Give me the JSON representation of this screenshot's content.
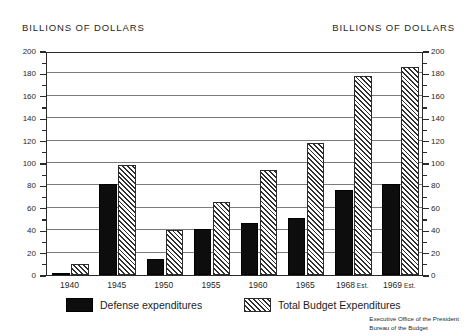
{
  "header": {
    "left_axis_title": "BILLIONS OF DOLLARS",
    "right_axis_title": "BILLIONS OF DOLLARS"
  },
  "legend": {
    "defense_label": "Defense expenditures",
    "total_label": "Total Budget Expenditures"
  },
  "footer": {
    "line1": "Executive Office of the President",
    "line2": "Bureau of the Budget"
  },
  "colors": {
    "defense_fill": "#0d0d0d",
    "total_hatch": "#2f2f2f",
    "total_background": "#f2f2f2",
    "frame": "#2a2a2a",
    "gridline": "#7b7b7b",
    "page_background": "#ffffff"
  },
  "chart_data": {
    "type": "bar",
    "title": "",
    "subtitle": "",
    "xlabel": "",
    "ylabel": "BILLIONS OF DOLLARS",
    "ylabel_right": "BILLIONS OF DOLLARS",
    "ylim": [
      0,
      200
    ],
    "yticks": [
      0,
      20,
      40,
      60,
      80,
      100,
      120,
      140,
      160,
      180,
      200
    ],
    "ytick_labels": [
      "0",
      "20",
      "40",
      "60",
      "80",
      "100",
      "120",
      "140",
      "160",
      "180",
      "200"
    ],
    "yminor_step": 10,
    "grid": true,
    "grid_axis": "y",
    "legend_position": "below",
    "dual_axis": true,
    "categories": [
      "1940",
      "1945",
      "1950",
      "1955",
      "1960",
      "1965",
      "1968 Est.",
      "1969 Est."
    ],
    "category_main": [
      "1940",
      "1945",
      "1950",
      "1955",
      "1960",
      "1965",
      "1968",
      "1969"
    ],
    "category_suffix": [
      "",
      "",
      "",
      "",
      "",
      "",
      "Est.",
      "Est."
    ],
    "series": [
      {
        "name": "Defense expenditures",
        "values": [
          1.8,
          81,
          14,
          41,
          46,
          51,
          76,
          81
        ]
      },
      {
        "name": "Total Budget Expenditures",
        "values": [
          9.5,
          98,
          40,
          65,
          94,
          118,
          178,
          186
        ]
      }
    ]
  }
}
